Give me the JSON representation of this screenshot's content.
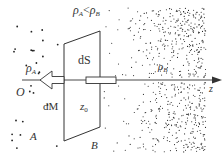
{
  "diagram": {
    "type": "physics-density-gradient",
    "colors": {
      "ink": "#333333",
      "dots": "#222222",
      "background": "#ffffff"
    },
    "labels": {
      "condition": {
        "rho": "ρ",
        "subA": "A",
        "lt": "<",
        "subB": "B"
      },
      "rho_A": {
        "rho": "ρ",
        "sub": "A"
      },
      "rho_B": {
        "rho": "ρ",
        "sub": "B"
      },
      "dS": "dS",
      "dM": "dM",
      "z0": {
        "z": "z",
        "sub": "0"
      },
      "origin": "O",
      "axis": "z",
      "A": "A",
      "B": "B"
    },
    "elements": {
      "surface": "parallelogram surface element dS",
      "tube": "thin tube through surface along z-axis",
      "arrow": "hollow force arrow pointing toward O",
      "axis": "z axis with arrowhead at right"
    }
  }
}
